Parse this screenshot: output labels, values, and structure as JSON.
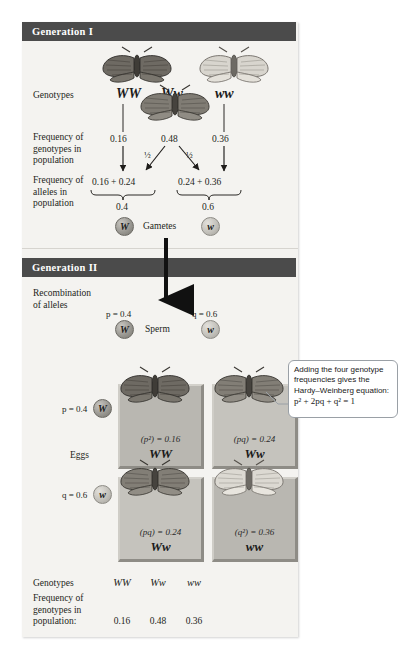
{
  "panel": {
    "sections": [
      {
        "id": "gen1",
        "title": "Generation I"
      },
      {
        "id": "gen2",
        "title": "Generation II"
      }
    ]
  },
  "generation1": {
    "genotypes_label": "Genotypes",
    "genotypes": [
      "WW",
      "Ww",
      "ww"
    ],
    "freq_genotypes_label": "Frequency of\ngenotypes in\npopulation",
    "freq_genotypes": [
      "0.16",
      "0.48",
      "0.36"
    ],
    "split_fractions": [
      "½",
      "½"
    ],
    "freq_alleles_label": "Frequency of\nalleles in\npopulation",
    "allele_sums": [
      "0.16 + 0.24",
      "0.24 + 0.36"
    ],
    "allele_totals": [
      "0.4",
      "0.6"
    ],
    "gametes_label": "Gametes",
    "gamete_alleles": [
      "W",
      "w"
    ]
  },
  "generation2": {
    "recombination_label": "Recombination\nof alleles",
    "sperm_label": "Sperm",
    "eggs_label": "Eggs",
    "sperm": [
      {
        "freq": "p = 0.4",
        "allele": "W"
      },
      {
        "freq": "q = 0.6",
        "allele": "w"
      }
    ],
    "eggs": [
      {
        "freq": "p = 0.4",
        "allele": "W"
      },
      {
        "freq": "q = 0.6",
        "allele": "w"
      }
    ],
    "punnett": [
      {
        "formula": "(p²) = 0.16",
        "genotype": "WW"
      },
      {
        "formula": "(pq) = 0.24",
        "genotype": "Ww"
      },
      {
        "formula": "(pq) = 0.24",
        "genotype": "Ww"
      },
      {
        "formula": "(q²) = 0.36",
        "genotype": "ww"
      }
    ]
  },
  "callout": {
    "text": "Adding the four genotype frequencies gives the Hardy–Weinberg equation:",
    "equation": "p² + 2pq + q² = 1"
  },
  "summary": {
    "genotypes_label": "Genotypes",
    "genotypes": [
      "WW",
      "Ww",
      "ww"
    ],
    "freq_label": "Frequency of\ngenotypes in\npopulation:",
    "freqs": [
      "0.16",
      "0.48",
      "0.36"
    ]
  },
  "colors": {
    "header_bar": "#4b4b4b",
    "panel_bg": "#f4f3f0",
    "punnett_cell": "#b9b7b1",
    "punnett_cell_light": "#c5c3bd",
    "callout_border": "#9aa0a6",
    "text": "#231f20"
  }
}
